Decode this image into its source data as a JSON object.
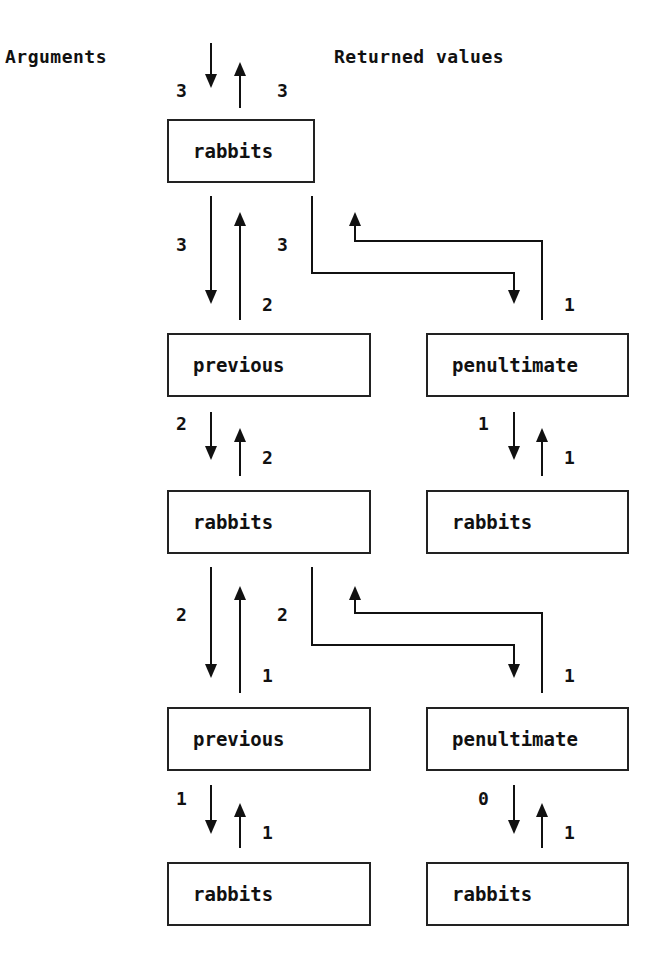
{
  "headers": {
    "arguments": "Arguments",
    "returned_values": "Returned values"
  },
  "boxes": [
    {
      "id": "b1",
      "label": "rabbits"
    },
    {
      "id": "b2",
      "label": "previous"
    },
    {
      "id": "b3",
      "label": "penultimate"
    },
    {
      "id": "b4",
      "label": "rabbits"
    },
    {
      "id": "b5",
      "label": "rabbits"
    },
    {
      "id": "b6",
      "label": "previous"
    },
    {
      "id": "b7",
      "label": "penultimate"
    },
    {
      "id": "b8",
      "label": "rabbits"
    },
    {
      "id": "b9",
      "label": "rabbits"
    }
  ],
  "labels": {
    "top_arg": "3",
    "top_ret": "3",
    "b1_prev_arg": "3",
    "b1_prev_ret": "2",
    "b1_pen_arg": "3",
    "b1_pen_ret": "1",
    "b2_rab_arg": "2",
    "b2_rab_ret": "2",
    "b3_rab_arg": "1",
    "b3_rab_ret": "1",
    "b4_prev_arg": "2",
    "b4_prev_ret": "1",
    "b4_pen_arg": "2",
    "b4_pen_ret": "1",
    "b6_rab_arg": "1",
    "b6_rab_ret": "1",
    "b7_rab_arg": "0",
    "b7_rab_ret": "1"
  }
}
